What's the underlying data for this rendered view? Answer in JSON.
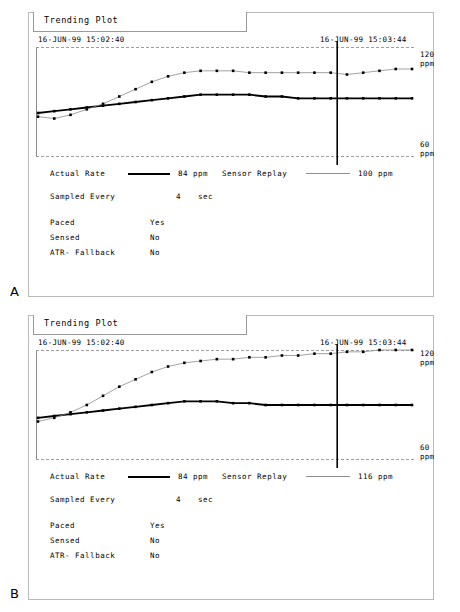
{
  "figure": {
    "letters": {
      "a": "A",
      "b": "B"
    }
  },
  "panels": [
    {
      "id": "panel-a",
      "title": "Trending Plot",
      "timestamp_start": "16-JUN-99 15:02:40",
      "timestamp_cursor": "16-JUN-99 15:03:44",
      "scale_top": "120\nppm",
      "scale_top_value": "120",
      "scale_top_unit": "ppm",
      "scale_bottom_value": "60",
      "scale_bottom_unit": "ppm",
      "legend": {
        "actual_label": "Actual Rate",
        "actual_value": "84  ppm",
        "sensor_label": "Sensor Replay",
        "sensor_value": "100 ppm"
      },
      "params": [
        {
          "key": "Sampled Every",
          "value": "4",
          "unit": "sec"
        },
        {
          "key": "Paced",
          "value": "Yes",
          "unit": ""
        },
        {
          "key": "Sensed",
          "value": "No",
          "unit": ""
        },
        {
          "key": "ATR- Fallback",
          "value": "No",
          "unit": ""
        }
      ]
    },
    {
      "id": "panel-b",
      "title": "Trending Plot",
      "timestamp_start": "16-JUN-99 15:02:40",
      "timestamp_cursor": "16-JUN-99 15:03:44",
      "scale_top_value": "120",
      "scale_top_unit": "ppm",
      "scale_bottom_value": "60",
      "scale_bottom_unit": "ppm",
      "legend": {
        "actual_label": "Actual Rate",
        "actual_value": "84  ppm",
        "sensor_label": "Sensor Replay",
        "sensor_value": "116 ppm"
      },
      "params": [
        {
          "key": "Sampled Every",
          "value": "4",
          "unit": "sec"
        },
        {
          "key": "Paced",
          "value": "Yes",
          "unit": ""
        },
        {
          "key": "Sensed",
          "value": "No",
          "unit": ""
        },
        {
          "key": "ATR- Fallback",
          "value": "No",
          "unit": ""
        }
      ]
    }
  ],
  "chart_data": [
    {
      "type": "line",
      "title": "Trending Plot",
      "panel": "A",
      "xlabel": "",
      "ylabel": "ppm",
      "ylim": [
        60,
        120
      ],
      "grid": "dashed horizontal at 60 and 120 ppm",
      "legend_position": "below plot",
      "cursor_x_fraction": 0.8,
      "cursor_label": "16-JUN-99 15:03:44",
      "x": [
        0,
        1,
        2,
        3,
        4,
        5,
        6,
        7,
        8,
        9,
        10,
        11,
        12,
        13,
        14,
        15,
        16,
        17,
        18,
        19,
        20,
        21,
        22,
        23
      ],
      "series": [
        {
          "name": "Actual Rate",
          "style": "thick-black",
          "value_label": "84 ppm",
          "values": [
            84,
            85,
            86,
            87,
            88,
            89,
            90,
            91,
            92,
            93,
            94,
            94,
            94,
            94,
            93,
            93,
            92,
            92,
            92,
            92,
            92,
            92,
            92,
            92
          ]
        },
        {
          "name": "Sensor Replay",
          "style": "thin-gray",
          "value_label": "100 ppm",
          "values": [
            82,
            81,
            83,
            86,
            89,
            93,
            97,
            101,
            104,
            106,
            107,
            107,
            107,
            106,
            106,
            106,
            106,
            106,
            106,
            105,
            106,
            107,
            108,
            108
          ]
        }
      ]
    },
    {
      "type": "line",
      "title": "Trending Plot",
      "panel": "B",
      "xlabel": "",
      "ylabel": "ppm",
      "ylim": [
        60,
        120
      ],
      "grid": "dashed horizontal at 60 and 120 ppm",
      "legend_position": "below plot",
      "cursor_x_fraction": 0.8,
      "cursor_label": "16-JUN-99 15:03:44",
      "x": [
        0,
        1,
        2,
        3,
        4,
        5,
        6,
        7,
        8,
        9,
        10,
        11,
        12,
        13,
        14,
        15,
        16,
        17,
        18,
        19,
        20,
        21,
        22,
        23
      ],
      "series": [
        {
          "name": "Actual Rate",
          "style": "thick-black",
          "value_label": "84 ppm",
          "values": [
            83,
            84,
            85,
            86,
            87,
            88,
            89,
            90,
            91,
            92,
            92,
            92,
            91,
            91,
            90,
            90,
            90,
            90,
            90,
            90,
            90,
            90,
            90,
            90
          ]
        },
        {
          "name": "Sensor Replay",
          "style": "thin-gray",
          "value_label": "116 ppm",
          "values": [
            81,
            83,
            86,
            90,
            95,
            100,
            104,
            108,
            111,
            113,
            114,
            115,
            115,
            116,
            116,
            117,
            117,
            118,
            118,
            119,
            119,
            120,
            120,
            120
          ]
        }
      ]
    }
  ]
}
